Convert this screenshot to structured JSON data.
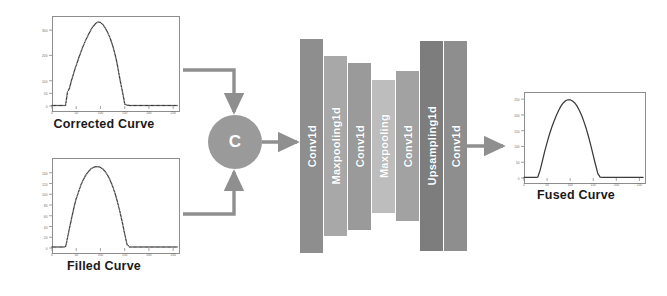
{
  "diagram": {
    "background_color": "#ffffff",
    "arrow_color": "#8f8f8f",
    "concat": {
      "label": "C",
      "name": "concatenate",
      "fill": "#9a9a9a",
      "text_color": "#ffffff"
    },
    "inputs": [
      {
        "caption": "Corrected Curve",
        "chart_data": {
          "type": "line",
          "title": "Corrected Curve",
          "xlabel": "",
          "ylabel": "",
          "xlim": [
            0,
            260
          ],
          "ylim": [
            0,
            340
          ],
          "xticks": [
            0,
            50,
            100,
            150,
            200,
            250
          ],
          "yticks": [
            0,
            50,
            100,
            200,
            300
          ],
          "grid": false,
          "legend": "none",
          "marker": "dots",
          "x": [
            0,
            5,
            10,
            15,
            20,
            25,
            28,
            30,
            32,
            34,
            36,
            38,
            40,
            44,
            48,
            52,
            56,
            60,
            65,
            70,
            75,
            80,
            85,
            90,
            95,
            100,
            105,
            110,
            115,
            120,
            125,
            130,
            133,
            136,
            139,
            142,
            145,
            148,
            150,
            155,
            160,
            170,
            180,
            190,
            200,
            210,
            220,
            230,
            240,
            250,
            258
          ],
          "y": [
            2,
            2,
            2,
            2,
            2,
            2,
            3,
            30,
            55,
            62,
            70,
            85,
            100,
            125,
            150,
            172,
            195,
            215,
            240,
            262,
            282,
            300,
            315,
            326,
            332,
            330,
            322,
            308,
            290,
            268,
            240,
            205,
            180,
            150,
            118,
            88,
            60,
            30,
            8,
            3,
            2,
            2,
            2,
            2,
            2,
            2,
            2,
            2,
            2,
            2,
            2
          ]
        }
      },
      {
        "caption": "Filled Curve",
        "chart_data": {
          "type": "line",
          "title": "Filled Curve",
          "xlabel": "",
          "ylabel": "",
          "xlim": [
            0,
            260
          ],
          "ylim": [
            0,
            160
          ],
          "xticks": [
            0,
            50,
            100,
            150,
            200,
            250
          ],
          "yticks": [
            0,
            20,
            40,
            60,
            80,
            100,
            120,
            140
          ],
          "grid": false,
          "legend": "none",
          "marker": "dots",
          "x": [
            0,
            5,
            10,
            15,
            20,
            25,
            28,
            30,
            34,
            38,
            42,
            46,
            50,
            55,
            60,
            65,
            70,
            75,
            80,
            85,
            90,
            95,
            100,
            105,
            110,
            115,
            120,
            125,
            130,
            135,
            140,
            145,
            150,
            155,
            160,
            170,
            180,
            190,
            200,
            210,
            220,
            230,
            240,
            250,
            258
          ],
          "y": [
            2,
            2,
            2,
            2,
            2,
            2,
            3,
            10,
            28,
            45,
            62,
            78,
            92,
            105,
            118,
            128,
            136,
            142,
            147,
            150,
            151,
            151,
            150,
            147,
            142,
            135,
            126,
            115,
            102,
            86,
            68,
            48,
            26,
            6,
            2,
            2,
            2,
            2,
            2,
            2,
            2,
            2,
            2,
            2,
            2
          ]
        }
      }
    ],
    "output": {
      "caption": "Fused Curve",
      "chart_data": {
        "type": "line",
        "title": "Fused Curve",
        "xlabel": "",
        "ylabel": "",
        "xlim": [
          0,
          260
        ],
        "ylim": [
          0,
          260
        ],
        "xticks": [
          0,
          50,
          100,
          150,
          200,
          250
        ],
        "yticks": [
          0,
          50,
          100,
          150,
          200,
          250
        ],
        "grid": false,
        "legend": "none",
        "marker": "line",
        "x": [
          0,
          5,
          10,
          15,
          20,
          25,
          30,
          35,
          40,
          45,
          50,
          55,
          60,
          65,
          70,
          75,
          80,
          85,
          90,
          95,
          100,
          105,
          110,
          115,
          120,
          125,
          130,
          135,
          140,
          145,
          150,
          155,
          160,
          165,
          170,
          180,
          190,
          200,
          210,
          220,
          230,
          240,
          250,
          258
        ],
        "y": [
          2,
          2,
          2,
          2,
          2,
          2,
          3,
          25,
          55,
          85,
          112,
          138,
          160,
          180,
          198,
          214,
          228,
          238,
          245,
          248,
          248,
          244,
          238,
          228,
          214,
          198,
          178,
          156,
          130,
          102,
          72,
          42,
          14,
          3,
          2,
          2,
          2,
          2,
          2,
          2,
          2,
          2,
          2,
          2
        ]
      }
    },
    "network": {
      "name": "encoder-decoder-1d-cnn",
      "layers": [
        {
          "label": "Conv1d",
          "fill": "#8e8e8e",
          "height_ratio": 1.0
        },
        {
          "label": "Maxpooling1d",
          "fill": "#a8a8a8",
          "height_ratio": 0.84
        },
        {
          "label": "Conv1d",
          "fill": "#9a9a9a",
          "height_ratio": 0.78
        },
        {
          "label": "Maxpooling",
          "fill": "#bdbdbd",
          "height_ratio": 0.62
        },
        {
          "label": "Conv1d",
          "fill": "#a2a2a2",
          "height_ratio": 0.7
        },
        {
          "label": "Upsampling1d",
          "fill": "#7d7d7d",
          "height_ratio": 0.98
        },
        {
          "label": "Conv1d",
          "fill": "#8e8e8e",
          "height_ratio": 0.98
        }
      ]
    },
    "arrows": [
      {
        "name": "corrected-to-concat",
        "kind": "elbow-down"
      },
      {
        "name": "filled-to-concat",
        "kind": "elbow-up"
      },
      {
        "name": "concat-to-network",
        "kind": "straight-right"
      },
      {
        "name": "network-to-fused",
        "kind": "straight-right"
      }
    ]
  }
}
